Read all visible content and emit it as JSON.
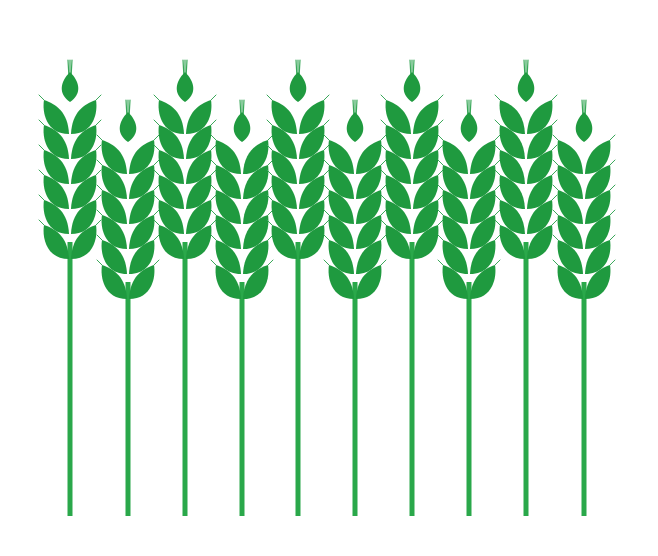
{
  "illustration": {
    "subject": "wheat-stalks",
    "background": "#ffffff",
    "colors": {
      "grain": "#1f9a3f",
      "stem": "#2aa84a",
      "awn": "#3aa85a"
    },
    "stem_bottom": 516,
    "stalks": [
      {
        "x": 70,
        "tip": 60,
        "height": "tall"
      },
      {
        "x": 128,
        "tip": 100,
        "height": "short"
      },
      {
        "x": 185,
        "tip": 60,
        "height": "tall"
      },
      {
        "x": 242,
        "tip": 100,
        "height": "short"
      },
      {
        "x": 298,
        "tip": 60,
        "height": "tall"
      },
      {
        "x": 355,
        "tip": 100,
        "height": "short"
      },
      {
        "x": 412,
        "tip": 60,
        "height": "tall"
      },
      {
        "x": 469,
        "tip": 100,
        "height": "short"
      },
      {
        "x": 526,
        "tip": 60,
        "height": "tall"
      },
      {
        "x": 584,
        "tip": 100,
        "height": "short"
      }
    ]
  }
}
